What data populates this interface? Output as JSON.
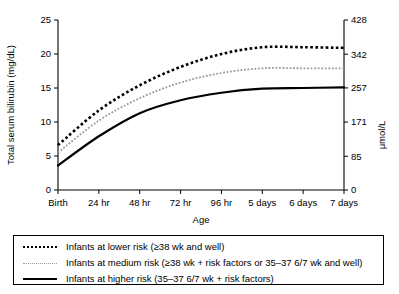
{
  "chart_data": {
    "type": "line",
    "title": "",
    "xlabel": "Age",
    "ylabel": "Total serum bilirubin (mg/dL)",
    "y2label": "μmol/L",
    "categories": [
      "Birth",
      "24 hr",
      "48 hr",
      "72 hr",
      "96 hr",
      "5 days",
      "6 days",
      "7 days"
    ],
    "x": [
      0,
      1,
      2,
      3,
      4,
      5,
      6,
      7
    ],
    "ylim": [
      0,
      25
    ],
    "yticks": [
      0,
      5,
      10,
      15,
      20,
      25
    ],
    "ytick_labels": [
      "0",
      "5",
      "10",
      "15",
      "20",
      "25"
    ],
    "y2lim": [
      0,
      428
    ],
    "y2ticks": [
      0,
      85,
      171,
      257,
      342,
      428
    ],
    "y2tick_labels": [
      "0",
      "85",
      "171",
      "257",
      "342",
      "428"
    ],
    "grid": false,
    "legend_position": "below-plot",
    "series": [
      {
        "name": "Infants at lower risk (≥38 wk and well)",
        "style": "dotted",
        "color": "#000000",
        "width": 2.6,
        "values": [
          6.6,
          11.7,
          15.4,
          18.1,
          20.0,
          21.0,
          21.0,
          20.9
        ]
      },
      {
        "name": "Infants at medium risk (≥38 wk + risk factors or 35–37 6/7 wk and well)",
        "style": "dotted",
        "color": "#9a9a9a",
        "width": 1.8,
        "values": [
          5.5,
          10.2,
          13.5,
          15.8,
          17.2,
          17.9,
          17.9,
          17.9
        ]
      },
      {
        "name": "Infants at higher risk (35–37 6/7 wk + risk factors)",
        "style": "solid",
        "color": "#000000",
        "width": 2.2,
        "values": [
          3.6,
          7.9,
          11.3,
          13.2,
          14.3,
          14.9,
          15.0,
          15.1
        ]
      }
    ]
  },
  "legend": {
    "items": [
      {
        "label": "Infants at lower risk (≥38 wk and well)",
        "sample": "lower-risk-line-sample"
      },
      {
        "label": "Infants at medium risk (≥38 wk + risk factors or 35–37 6/7 wk and well)",
        "sample": "medium-risk-line-sample"
      },
      {
        "label": "Infants at higher risk (35–37 6/7 wk + risk factors)",
        "sample": "higher-risk-line-sample"
      }
    ]
  }
}
